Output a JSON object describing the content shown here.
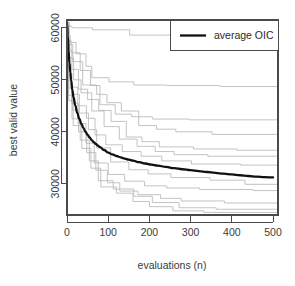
{
  "chart_data": {
    "type": "line",
    "title": "",
    "xlabel": "evaluations (n)",
    "ylabel": "best valid value",
    "xlim": [
      0,
      512
    ],
    "ylim": [
      24000,
      61500
    ],
    "xticks": [
      0,
      100,
      200,
      300,
      400,
      500
    ],
    "xticklabels": [
      "0",
      "100",
      "200",
      "300",
      "400",
      "500"
    ],
    "yticks": [
      30000,
      40000,
      50000,
      60000
    ],
    "yticklabels": [
      "30000",
      "40000",
      "50000",
      "60000"
    ],
    "grid": false,
    "legend": {
      "position": "top-right",
      "entries": [
        {
          "label": "average OIC",
          "color": "#111111",
          "linewidth": 2.3
        }
      ]
    },
    "colors": {
      "average_line": "#111111",
      "run_lines": "#b4b4b4",
      "axis": "#4a4a4a",
      "background": "#ffffff"
    },
    "series": [
      {
        "name": "average OIC",
        "emphasis": true,
        "x": [
          0,
          2,
          4,
          6,
          8,
          10,
          13,
          16,
          20,
          25,
          30,
          35,
          40,
          45,
          50,
          55,
          60,
          65,
          70,
          75,
          80,
          90,
          100,
          110,
          120,
          130,
          140,
          150,
          160,
          175,
          190,
          205,
          220,
          240,
          260,
          280,
          300,
          320,
          340,
          360,
          380,
          400,
          420,
          440,
          460,
          480,
          500
        ],
        "y": [
          60800,
          58400,
          55500,
          53200,
          51400,
          49900,
          48000,
          46600,
          45100,
          43600,
          42500,
          41500,
          40700,
          40000,
          39400,
          38900,
          38400,
          38000,
          37650,
          37350,
          37050,
          36500,
          36000,
          35650,
          35350,
          35100,
          34850,
          34650,
          34450,
          34150,
          33900,
          33700,
          33500,
          33250,
          33000,
          32800,
          32620,
          32440,
          32270,
          32100,
          31950,
          31800,
          31640,
          31500,
          31380,
          31280,
          31220
        ]
      },
      {
        "name": "run-1",
        "x": [
          0,
          5,
          12,
          60,
          62,
          150,
          152,
          330,
          332,
          512
        ],
        "y": [
          61000,
          60300,
          60000,
          60000,
          59600,
          59600,
          58600,
          58600,
          57400,
          55500
        ]
      },
      {
        "name": "run-2",
        "x": [
          0,
          4,
          8,
          20,
          22,
          44,
          46,
          58,
          60,
          100,
          102,
          160,
          162,
          240,
          242,
          370,
          372,
          512
        ],
        "y": [
          61000,
          58500,
          57200,
          57200,
          55000,
          55000,
          52600,
          52600,
          50400,
          50400,
          49600,
          49600,
          49000,
          49000,
          48900,
          48900,
          48700,
          48500
        ]
      },
      {
        "name": "run-3",
        "x": [
          0,
          3,
          10,
          30,
          32,
          55,
          57,
          78,
          80,
          115,
          117,
          155,
          157,
          205,
          207,
          295,
          297,
          512
        ],
        "y": [
          61000,
          57500,
          55200,
          55200,
          51800,
          51800,
          48900,
          48900,
          45200,
          45200,
          43400,
          43400,
          42900,
          42900,
          42450,
          42450,
          42300,
          42100
        ]
      },
      {
        "name": "run-4",
        "x": [
          0,
          4,
          14,
          36,
          38,
          70,
          72,
          95,
          97,
          130,
          132,
          172,
          174,
          215,
          217,
          262,
          264,
          350,
          352,
          512
        ],
        "y": [
          61000,
          56800,
          53500,
          53500,
          49000,
          49000,
          47200,
          47200,
          45600,
          45600,
          44000,
          44000,
          41200,
          41200,
          40500,
          40500,
          40000,
          40000,
          39500,
          39100
        ]
      },
      {
        "name": "run-5",
        "x": [
          0,
          3,
          12,
          26,
          28,
          48,
          50,
          75,
          77,
          105,
          107,
          142,
          144,
          180,
          182,
          222,
          224,
          305,
          307,
          410,
          412,
          512
        ],
        "y": [
          61000,
          55600,
          52000,
          52000,
          48200,
          48200,
          46200,
          46200,
          44100,
          44100,
          42000,
          42000,
          39000,
          39000,
          38100,
          38100,
          37100,
          37100,
          36700,
          36700,
          36450,
          36300
        ]
      },
      {
        "name": "run-6",
        "x": [
          0,
          4,
          16,
          32,
          34,
          58,
          60,
          88,
          90,
          125,
          127,
          168,
          170,
          212,
          214,
          258,
          260,
          340,
          342,
          512
        ],
        "y": [
          61000,
          54200,
          50000,
          50000,
          47500,
          47500,
          44000,
          44000,
          41000,
          41000,
          38600,
          38600,
          37200,
          37200,
          36200,
          36200,
          35600,
          35600,
          35300,
          35050
        ]
      },
      {
        "name": "run-7",
        "x": [
          0,
          3,
          10,
          24,
          26,
          45,
          47,
          66,
          68,
          92,
          94,
          132,
          134,
          178,
          180,
          228,
          230,
          300,
          302,
          420,
          422,
          512
        ],
        "y": [
          61000,
          53000,
          48600,
          48600,
          45000,
          45000,
          42600,
          42600,
          39400,
          39400,
          37500,
          37500,
          36200,
          36200,
          35300,
          35300,
          34400,
          34400,
          33800,
          33800,
          33600,
          33400
        ]
      },
      {
        "name": "run-8",
        "x": [
          0,
          4,
          12,
          28,
          30,
          50,
          52,
          70,
          72,
          104,
          106,
          148,
          150,
          195,
          197,
          250,
          252,
          345,
          347,
          430,
          432,
          512
        ],
        "y": [
          61000,
          51200,
          47200,
          47200,
          43600,
          43600,
          40400,
          40400,
          36900,
          36900,
          34200,
          34200,
          32700,
          32700,
          31900,
          31900,
          31200,
          31200,
          30700,
          30700,
          29900,
          29500
        ]
      },
      {
        "name": "run-9",
        "x": [
          0,
          3,
          11,
          25,
          27,
          44,
          46,
          64,
          66,
          98,
          100,
          138,
          140,
          186,
          188,
          240,
          242,
          320,
          322,
          450,
          452,
          512
        ],
        "y": [
          61000,
          49800,
          45500,
          45500,
          41600,
          41600,
          37800,
          37800,
          34000,
          34000,
          31800,
          31800,
          30500,
          30500,
          29600,
          29600,
          29200,
          29200,
          28900,
          28900,
          28700,
          28600
        ]
      },
      {
        "name": "run-10",
        "x": [
          0,
          4,
          13,
          26,
          28,
          46,
          48,
          68,
          70,
          96,
          98,
          126,
          128,
          170,
          172,
          225,
          227,
          275,
          277,
          380,
          382,
          512
        ],
        "y": [
          61000,
          48400,
          44200,
          44200,
          40000,
          40000,
          36000,
          36000,
          32600,
          32600,
          30200,
          30200,
          28600,
          28600,
          27900,
          27900,
          27200,
          27200,
          26700,
          26700,
          26300,
          26200
        ]
      },
      {
        "name": "run-11",
        "x": [
          0,
          3,
          12,
          30,
          32,
          52,
          54,
          74,
          76,
          110,
          112,
          160,
          162,
          205,
          207,
          270,
          272,
          360,
          362,
          512
        ],
        "y": [
          61000,
          47000,
          42500,
          42500,
          38400,
          38400,
          34400,
          34400,
          30600,
          30600,
          29000,
          29000,
          27600,
          27600,
          26400,
          26400,
          25400,
          25400,
          25100,
          25000
        ]
      },
      {
        "name": "run-12",
        "x": [
          0,
          4,
          15,
          34,
          36,
          56,
          58,
          80,
          82,
          118,
          120,
          158,
          160,
          198,
          200,
          255,
          257,
          330,
          332,
          512
        ],
        "y": [
          61000,
          46000,
          41200,
          41200,
          36800,
          36800,
          33000,
          33000,
          29400,
          29400,
          28200,
          28200,
          26600,
          26600,
          25600,
          25600,
          24800,
          24800,
          24500,
          24400
        ]
      }
    ]
  }
}
